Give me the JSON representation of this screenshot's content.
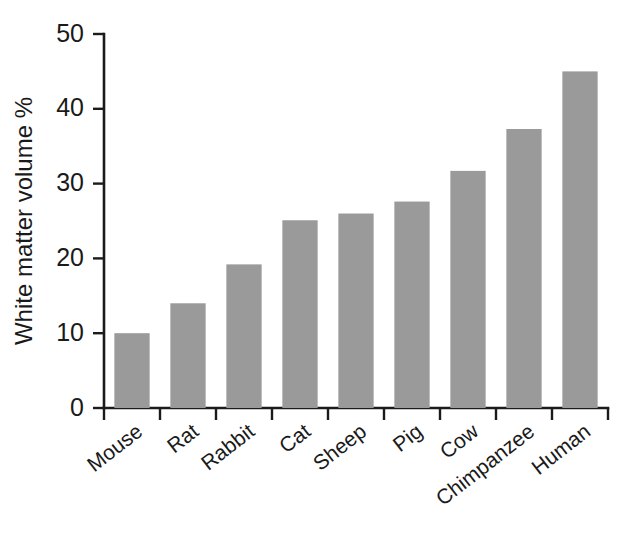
{
  "chart_data": {
    "type": "bar",
    "title": "",
    "subtitle": "",
    "xlabel": "",
    "ylabel": "White matter volume %",
    "categories": [
      "Mouse",
      "Rat",
      "Rabbit",
      "Cat",
      "Sheep",
      "Pig",
      "Cow",
      "Chimpanzee",
      "Human"
    ],
    "values": [
      10.0,
      14.0,
      19.2,
      25.1,
      26.0,
      27.6,
      31.7,
      37.3,
      45.0
    ],
    "ylim": [
      0,
      50
    ],
    "yticks": [
      0,
      10,
      20,
      30,
      40,
      50
    ],
    "ytick_labels": [
      "0",
      "10",
      "20",
      "30",
      "40",
      "50"
    ],
    "grid": false,
    "legend": "none",
    "bar_color": "#9a9a9a",
    "axis_color": "#1b1b1b",
    "background_color": "#ffffff",
    "xtick_label_rotation_deg": 38,
    "series": [
      {
        "name": "White matter volume %",
        "values": [
          10.0,
          14.0,
          19.2,
          25.1,
          26.0,
          27.6,
          31.7,
          37.3,
          45.0
        ]
      }
    ]
  }
}
